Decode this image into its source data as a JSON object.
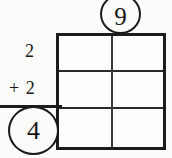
{
  "worksheet": {
    "kind": "addition-with-grid",
    "background_color": "#fbfbfa",
    "ink_color": "#1c1c1c"
  },
  "problem": {
    "addend_top": "2",
    "addend_bottom": "+ 2",
    "sum_label": "4",
    "top_circled_label": "9"
  },
  "grid": {
    "columns": 2,
    "rows": 3,
    "cells": [
      [
        "",
        ""
      ],
      [
        "",
        ""
      ],
      [
        "",
        ""
      ]
    ]
  },
  "chart_data": {
    "type": "table",
    "title": "",
    "columns": 2,
    "rows": 3,
    "values": [
      [
        "",
        ""
      ],
      [
        "",
        ""
      ],
      [
        "",
        ""
      ]
    ],
    "annotations": [
      "9",
      "2",
      "+ 2",
      "4"
    ]
  }
}
